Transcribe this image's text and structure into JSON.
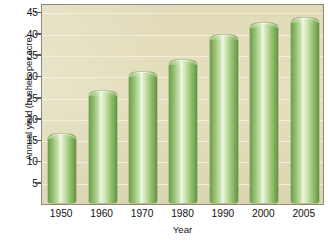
{
  "chart_data": {
    "type": "bar",
    "title": "",
    "xlabel": "Year",
    "ylabel": "Annual yield (bushels per acre)",
    "categories": [
      "1950",
      "1960",
      "1970",
      "1980",
      "1990",
      "2000",
      "2005"
    ],
    "values": [
      16.3,
      26.3,
      30.8,
      33.5,
      39.5,
      42.3,
      43.5
    ],
    "ylim": [
      0,
      46
    ],
    "yticks": [
      5,
      10,
      15,
      20,
      25,
      30,
      35,
      40,
      45
    ],
    "ytick_labels": [
      "5",
      "10",
      "15",
      "20",
      "25",
      "30",
      "35",
      "40",
      "45"
    ],
    "grid": true,
    "grid_axis": "y",
    "legend": false,
    "legend_position": "none",
    "series": [
      {
        "name": "Annual yield",
        "values": [
          16.3,
          26.3,
          30.8,
          33.5,
          39.5,
          42.3,
          43.5
        ]
      }
    ]
  },
  "colors": {
    "plot_background": "#e3ddba",
    "plot_border": "#8d8a7c",
    "gridline": "#f2eedb",
    "bar_green_dark": "#5f9043",
    "bar_green_mid": "#9cc57c",
    "bar_green_light": "#e6f2d6",
    "text": "#111111",
    "page_background": "#ffffff"
  }
}
